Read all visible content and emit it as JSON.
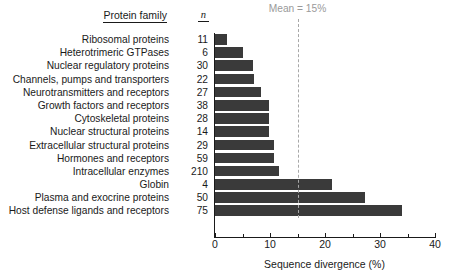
{
  "header": {
    "family_label": "Protein family",
    "n_label": "n"
  },
  "annotation": {
    "mean_text": "Mean = 15%",
    "mean_value": 15,
    "color": "#9a9a9a"
  },
  "axis": {
    "x_title": "Sequence divergence (%)",
    "x_ticks": [
      0,
      10,
      20,
      30,
      40
    ],
    "x_tick_labels": [
      "0",
      "10",
      "20",
      "30",
      "40"
    ],
    "x_minor_ticks": [
      5,
      15,
      25,
      35
    ],
    "xlim": [
      0,
      40
    ]
  },
  "style": {
    "bar_color": "#3a3a3a",
    "axis_color": "#1a1a1a",
    "mean_line_color": "#a8a8a8"
  },
  "chart_data": {
    "type": "bar",
    "orientation": "horizontal",
    "title": "",
    "xlabel": "Sequence divergence (%)",
    "ylabel": "Protein family",
    "xlim": [
      0,
      40
    ],
    "grid": false,
    "legend": null,
    "categories": [
      "Ribosomal proteins",
      "Heterotrimeric GTPases",
      "Nuclear regulatory proteins",
      "Channels, pumps and transporters",
      "Neurotransmitters and receptors",
      "Growth factors and receptors",
      "Cytoskeletal proteins",
      "Nuclear structural proteins",
      "Extracellular structural proteins",
      "Hormones and receptors",
      "Intracellular enzymes",
      "Globin",
      "Plasma and exocrine proteins",
      "Host defense ligands and receptors"
    ],
    "n_values": [
      11,
      6,
      30,
      22,
      27,
      38,
      28,
      14,
      29,
      59,
      210,
      4,
      50,
      75
    ],
    "values": [
      2.2,
      5.1,
      6.9,
      7.0,
      8.3,
      9.8,
      9.9,
      9.9,
      10.7,
      10.8,
      11.6,
      21.3,
      27.2,
      34.0
    ],
    "annotations": [
      {
        "label": "Mean = 15%",
        "x": 15,
        "type": "vline",
        "style": "dashed"
      }
    ]
  }
}
